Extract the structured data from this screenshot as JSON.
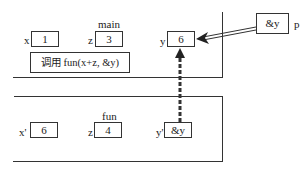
{
  "main_frame": {
    "title": "main",
    "vars": [
      {
        "name": "x",
        "value": "1"
      },
      {
        "name": "z",
        "value": "3"
      },
      {
        "name": "y",
        "value": "6"
      }
    ],
    "call_text": "调用 fun(x+z, &y)"
  },
  "fun_frame": {
    "title": "fun",
    "vars": [
      {
        "name": "x'",
        "value": "6"
      },
      {
        "name": "z",
        "value": "4"
      },
      {
        "name": "y'",
        "value": "&y"
      }
    ]
  },
  "pointer": {
    "name": "p",
    "value": "&y"
  },
  "colors": {
    "line": "#333333",
    "background": "#ffffff"
  }
}
